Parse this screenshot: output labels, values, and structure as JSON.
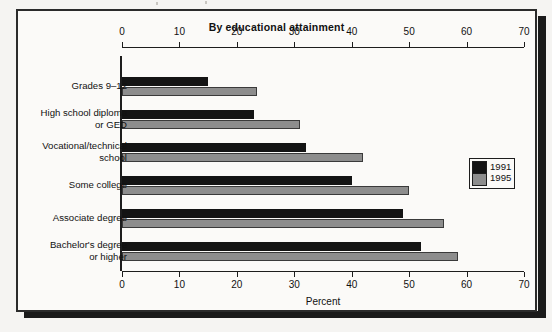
{
  "chart_data": {
    "type": "bar",
    "orientation": "horizontal",
    "title": "By educational attainment",
    "xlabel": "Percent",
    "ylabel": "",
    "xlim": [
      0,
      70
    ],
    "xticks": [
      0,
      10,
      20,
      30,
      40,
      50,
      60,
      70
    ],
    "grid": false,
    "legend_position": "right-middle",
    "categories": [
      "Grades 9–12",
      "High school diploma\nor GED",
      "Vocational/technical\nschool",
      "Some college",
      "Associate degree",
      "Bachelor's degree\nor higher"
    ],
    "series": [
      {
        "name": "1991",
        "color": "#141414",
        "values": [
          15,
          23,
          32,
          40,
          49,
          52
        ]
      },
      {
        "name": "1995",
        "color": "#8d8d8d",
        "values": [
          23.5,
          31,
          42,
          50,
          56,
          58.5
        ]
      }
    ]
  },
  "legend": {
    "items": [
      {
        "label": "1991",
        "swatch": "black"
      },
      {
        "label": "1995",
        "swatch": "gray"
      }
    ]
  }
}
